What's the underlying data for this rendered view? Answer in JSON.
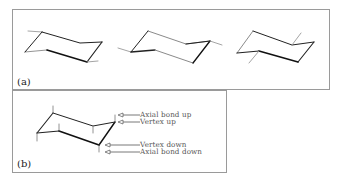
{
  "figure": {
    "panels": [
      {
        "id": "a",
        "label": "(a)",
        "description": "Three chair conformations drawn in perspective"
      },
      {
        "id": "b",
        "label": "(b)",
        "description": "Labeled chair conformation with axial bonds"
      }
    ],
    "annotations": [
      {
        "id": "axial-bond-up",
        "text": "Axial bond up"
      },
      {
        "id": "vertex-up",
        "text": "Vertex up"
      },
      {
        "id": "vertex-down",
        "text": "Vertex down"
      },
      {
        "id": "axial-bond-down",
        "text": "Axial bond down"
      }
    ],
    "colors": {
      "frame": "#9a9a9a",
      "front_bond": "#1a1a1a",
      "back_bond": "#8a8a8a",
      "annotation_text": "#555555"
    }
  }
}
